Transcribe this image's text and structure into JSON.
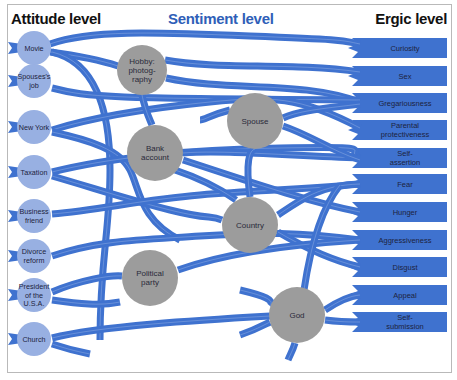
{
  "headers": {
    "attitude": "Attitude level",
    "sentiment": "Sentiment level",
    "ergic": "Ergic level"
  },
  "colors": {
    "path": "#3f72cf",
    "attitude_node": "#98b0e2",
    "sentiment_node": "#9c9c9c",
    "header_sentiment": "#2f5fb8",
    "ergic_band": "#3f72cf",
    "text_dark": "#1d2340"
  },
  "attitudes": [
    {
      "id": "movie",
      "lines": [
        "Movie"
      ],
      "x": 34,
      "y": 48
    },
    {
      "id": "spouses-job",
      "lines": [
        "Spouses's",
        "job"
      ],
      "x": 34,
      "y": 81
    },
    {
      "id": "new-york",
      "lines": [
        "New York"
      ],
      "x": 34,
      "y": 127
    },
    {
      "id": "taxation",
      "lines": [
        "Taxation"
      ],
      "x": 34,
      "y": 172
    },
    {
      "id": "business-friend",
      "lines": [
        "Business",
        "friend"
      ],
      "x": 34,
      "y": 216
    },
    {
      "id": "divorce-reform",
      "lines": [
        "Divorce",
        "reform"
      ],
      "x": 34,
      "y": 256
    },
    {
      "id": "president",
      "lines": [
        "President",
        "of the",
        "U.S.A."
      ],
      "x": 34,
      "y": 295
    },
    {
      "id": "church",
      "lines": [
        "Church"
      ],
      "x": 34,
      "y": 339
    }
  ],
  "sentiments": [
    {
      "id": "hobby",
      "lines": [
        "Hobby:",
        "photog-",
        "raphy"
      ],
      "x": 142,
      "y": 70,
      "r": 25
    },
    {
      "id": "bank",
      "lines": [
        "Bank",
        "account"
      ],
      "x": 155,
      "y": 153,
      "r": 28
    },
    {
      "id": "spouse",
      "lines": [
        "Spouse"
      ],
      "x": 255,
      "y": 121,
      "r": 28
    },
    {
      "id": "country",
      "lines": [
        "Country"
      ],
      "x": 250,
      "y": 225,
      "r": 28
    },
    {
      "id": "party",
      "lines": [
        "Political",
        "party"
      ],
      "x": 150,
      "y": 278,
      "r": 28
    },
    {
      "id": "god",
      "lines": [
        "God"
      ],
      "x": 297,
      "y": 315,
      "r": 28
    }
  ],
  "ergics": [
    {
      "id": "curiosity",
      "lines": [
        "Curiosity"
      ],
      "y": 48
    },
    {
      "id": "sex",
      "lines": [
        "Sex"
      ],
      "y": 76
    },
    {
      "id": "gregariousness",
      "lines": [
        "Gregariousness"
      ],
      "y": 103
    },
    {
      "id": "parental",
      "lines": [
        "Parental",
        "protectiveness"
      ],
      "y": 130
    },
    {
      "id": "self-assertion",
      "lines": [
        "Self-",
        "assertion"
      ],
      "y": 158
    },
    {
      "id": "fear",
      "lines": [
        "Fear"
      ],
      "y": 184
    },
    {
      "id": "hunger",
      "lines": [
        "Hunger"
      ],
      "y": 212
    },
    {
      "id": "aggressiveness",
      "lines": [
        "Aggressiveness"
      ],
      "y": 240
    },
    {
      "id": "disgust",
      "lines": [
        "Disgust"
      ],
      "y": 267
    },
    {
      "id": "appeal",
      "lines": [
        "Appeal"
      ],
      "y": 295
    },
    {
      "id": "self-submission",
      "lines": [
        "Self-",
        "submission"
      ],
      "y": 322
    }
  ],
  "paths": [
    "M50,44 C90,30 150,32 250,36 S340,40 360,44",
    "M50,52 C80,56 100,60 118,66",
    "M52,52 C95,62 110,110 110,170 S100,260 100,340",
    "M165,60 C220,70 290,62 360,72",
    "M166,78 C230,92 300,80 360,102",
    "M52,88 C90,98 110,98 360,100",
    "M52,130 C90,118 150,108 210,102 S300,96 360,128",
    "M52,132 C90,140 120,150 130,170 S140,220 180,240",
    "M142,95 C145,110 150,120 152,125",
    "M52,172 C100,160 170,150 280,148 S340,150 360,158",
    "M52,176 C100,190 130,200 170,210 S210,215 222,220",
    "M52,214 C100,210 140,200 200,195 S300,190 360,184",
    "M52,256 C100,240 140,240 200,236 S300,232 360,240",
    "M52,292 C80,280 110,275 122,276",
    "M52,300 C80,304 100,306 120,302",
    "M52,338 C100,326 200,320 270,316",
    "M52,344 C70,350 80,352 90,354",
    "M183,153 C220,150 280,155 360,158",
    "M183,160 C230,175 300,200 360,212",
    "M283,118 C300,110 330,108 360,104",
    "M283,126 C310,135 330,150 360,160",
    "M278,215 C300,200 320,185 360,184",
    "M278,232 C300,245 330,260 360,267",
    "M178,270 C220,255 280,245 360,240",
    "M325,310 C340,300 350,296 360,295",
    "M325,320 C340,322 350,322 360,322",
    "M230,110 C210,115 205,120 200,120",
    "M240,290 C265,296 275,300 270,306",
    "M240,335 C255,330 262,326 270,322",
    "M295,343 C293,350 290,355 288,360",
    "M250,197 C245,160 250,150 255,149",
    "M236,200 C215,185 190,175 175,170",
    "M304,290 C310,250 320,210 340,185"
  ]
}
